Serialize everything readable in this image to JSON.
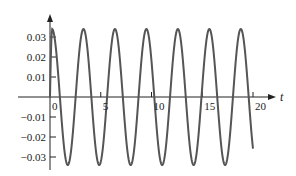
{
  "chart_data": {
    "type": "line",
    "title": "",
    "xlabel": "t",
    "ylabel": "",
    "xlim": [
      0,
      20
    ],
    "ylim": [
      -0.035,
      0.035
    ],
    "grid": false,
    "legend": null,
    "x_ticks": [
      0,
      5,
      10,
      15,
      20
    ],
    "x_tick_labels": [
      "0",
      "5",
      "10",
      "15",
      "20"
    ],
    "y_ticks": [
      0.03,
      0.02,
      0.01,
      -0.01,
      -0.02,
      -0.03
    ],
    "y_tick_labels": [
      "0.03",
      "0.02",
      "0.01",
      "−0.01",
      "−0.02",
      "−0.03"
    ],
    "series": [
      {
        "name": "oscillation",
        "description": "Sinusoid starting at origin, amplitude about 0.034, period about 3.1",
        "amplitude": 0.034,
        "period": 3.1,
        "x": [
          0,
          0.2,
          0.8,
          1.55,
          2.3,
          3.1,
          3.9,
          4.65,
          5.4,
          6.2,
          7.0,
          7.75,
          8.5,
          9.3,
          10.1,
          10.85,
          11.6,
          12.4,
          13.2,
          13.95,
          14.7,
          15.5,
          16.3,
          17.05,
          17.8,
          18.6,
          19.4,
          20.0
        ],
        "y": [
          0,
          0.033,
          0.0,
          -0.034,
          0.0,
          0.034,
          0.0,
          -0.034,
          0.0,
          0.034,
          0.0,
          -0.034,
          0.0,
          0.034,
          0.0,
          -0.034,
          0.0,
          0.034,
          0.0,
          -0.034,
          0.0,
          0.034,
          0.0,
          -0.034,
          0.0,
          0.034,
          0.0,
          -0.027
        ]
      }
    ]
  }
}
